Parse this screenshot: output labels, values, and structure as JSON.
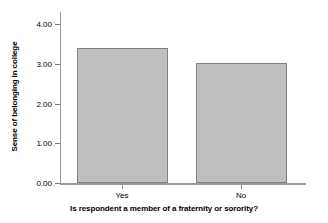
{
  "chart_data": {
    "type": "bar",
    "title": "",
    "subtitle": "",
    "categories": [
      "Yes",
      "No"
    ],
    "values": [
      3.4,
      3.02
    ],
    "series": [
      {
        "name": "Sense of belonging in college",
        "values": [
          3.4,
          3.02
        ]
      }
    ],
    "xlabel": "Is respondent a member of a fraternity or sorority?",
    "ylabel": "Sense of belonging in college",
    "ylim": [
      0.0,
      4.0
    ],
    "ytick_labels": [
      "0.00",
      "1.00",
      "2.00",
      "3.00",
      "4.00"
    ],
    "ytick_values": [
      0.0,
      1.0,
      2.0,
      3.0,
      4.0
    ],
    "grid": false,
    "legend": null,
    "annotations": [],
    "colors": {
      "bar_fill": "#bfbfbf",
      "bar_border": "#808080",
      "axis": "#9a9a9a",
      "text": "#000000",
      "background": "#ffffff"
    }
  }
}
